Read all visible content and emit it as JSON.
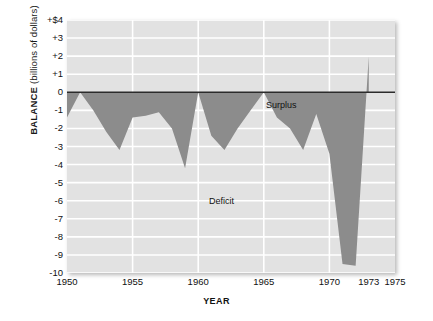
{
  "chart_data": {
    "type": "area",
    "title": "",
    "xlabel": "YEAR",
    "ylabel": "BALANCE (billions of dollars)",
    "ylabel_bold_part": "BALANCE",
    "ylabel_normal_part": "(billions of dollars)",
    "xlim": [
      1950,
      1975
    ],
    "ylim": [
      -10,
      4
    ],
    "grid": true,
    "legend_position": "none",
    "xticks": [
      1950,
      1955,
      1960,
      1965,
      1970,
      1973,
      1975
    ],
    "xtick_labels": [
      "1950",
      "1955",
      "1960",
      "1965",
      "1970",
      "1973",
      "1975"
    ],
    "yticks": [
      4,
      3,
      2,
      1,
      0,
      -1,
      -2,
      -3,
      -4,
      -5,
      -6,
      -7,
      -8,
      -9,
      -10
    ],
    "ytick_labels": [
      "+$4",
      "+3",
      "+2",
      "+1",
      "0",
      "-1",
      "-2",
      "-3",
      "-4",
      "-5",
      "-6",
      "-7",
      "-8",
      "-9",
      "-10"
    ],
    "annotations": [
      {
        "text": "Surplus",
        "x": 1960.0,
        "y": 0.9
      },
      {
        "text": "Deficit",
        "x": 1955.7,
        "y": -5.0
      }
    ],
    "zero_line": 0,
    "series": [
      {
        "name": "Federal budget balance",
        "fill_color": "#8c8c8c",
        "x": [
          1950,
          1951,
          1952,
          1953,
          1954,
          1955,
          1956,
          1957,
          1958,
          1959,
          1960,
          1961,
          1962,
          1963,
          1964,
          1965,
          1966,
          1967,
          1968,
          1969,
          1970,
          1971,
          1972,
          1973
        ],
        "values": [
          -1.4,
          0.0,
          -1.0,
          -2.2,
          -3.2,
          -1.4,
          -1.3,
          -1.1,
          -2.0,
          -4.2,
          0.0,
          -2.4,
          -3.2,
          -2.0,
          -1.0,
          0.0,
          -1.4,
          -2.0,
          -3.2,
          -1.2,
          -3.4,
          -9.5,
          -9.6,
          2.0
        ]
      }
    ],
    "plot_background": "#e2e2e2",
    "gridline_color": "#ffffff"
  },
  "figure": {
    "surplus_label": "Surplus",
    "deficit_label": "Deficit"
  }
}
